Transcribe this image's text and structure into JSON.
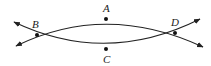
{
  "diagram": {
    "type": "geometry-curves",
    "stroke_color": "#222222",
    "points": [
      {
        "id": "A",
        "label": "A",
        "x": 106,
        "y": 19,
        "label_x": 103,
        "label_y": 12
      },
      {
        "id": "B",
        "label": "B",
        "x": 37,
        "y": 35,
        "label_x": 32,
        "label_y": 28
      },
      {
        "id": "C",
        "label": "C",
        "x": 106,
        "y": 49,
        "label_x": 103,
        "label_y": 63
      },
      {
        "id": "D",
        "label": "D",
        "x": 175,
        "y": 33,
        "label_x": 171,
        "label_y": 26
      }
    ],
    "curves": [
      {
        "name": "upper-curve",
        "path": "M16,46 Q106,2 203,47",
        "through": [
          "B",
          "A",
          "D"
        ],
        "arrows": "both"
      },
      {
        "name": "lower-curve",
        "path": "M14,22 Q106,66 200,19",
        "through": [
          "B",
          "C",
          "D"
        ],
        "arrows": "both"
      }
    ]
  }
}
